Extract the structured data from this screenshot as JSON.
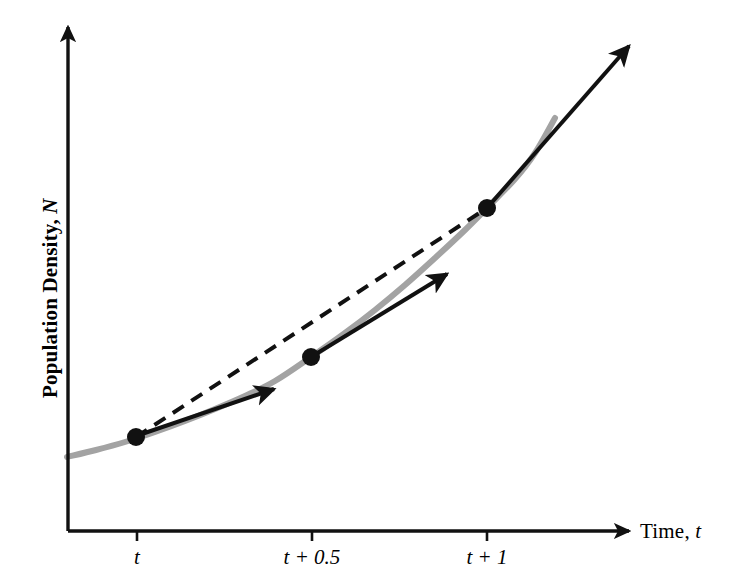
{
  "figure": {
    "kind": "line-chart-with-tangents",
    "background_color": "#ffffff",
    "curve_color": "#a3a3a3",
    "ink_color": "#111111"
  },
  "axes": {
    "y_title_text": "Population Density, ",
    "y_title_symbol": "N",
    "x_title_text": "Time, ",
    "x_title_symbol": "t",
    "x_tick_labels": [
      {
        "id": "tick-t",
        "text": "t"
      },
      {
        "id": "tick-t-half",
        "text": "t + 0.5"
      },
      {
        "id": "tick-t-one",
        "text": "t + 1"
      }
    ]
  },
  "chart_data": {
    "type": "line",
    "title": "",
    "subtitle": "",
    "xlabel": "Time, t",
    "ylabel": "Population Density, N",
    "grid": false,
    "legend": null,
    "axis_arrows": {
      "x": true,
      "y": true
    },
    "xlim": [
      0,
      1.6
    ],
    "ylim": [
      0,
      1.0
    ],
    "x_tick_values": [
      1.0,
      1.5,
      2.0
    ],
    "x_tick_text": [
      "t",
      "t + 0.5",
      "t + 1"
    ],
    "y_tick_values": [],
    "y_tick_text": [],
    "series": [
      {
        "name": "exponential population growth curve",
        "style": "solid",
        "color": "#a3a3a3",
        "width_px": 6,
        "points_px": [
          [
            67,
            457
          ],
          [
            96,
            450
          ],
          [
            125,
            442
          ],
          [
            155,
            432
          ],
          [
            185,
            421
          ],
          [
            215,
            409
          ],
          [
            245,
            396
          ],
          [
            275,
            381
          ],
          [
            311,
            357
          ],
          [
            345,
            333
          ],
          [
            375,
            310
          ],
          [
            405,
            285
          ],
          [
            435,
            258
          ],
          [
            465,
            230
          ],
          [
            487,
            208
          ],
          [
            515,
            179
          ],
          [
            535,
            153
          ],
          [
            555,
            118
          ]
        ]
      },
      {
        "name": "secant line (average rate of change, t to t+1)",
        "style": "dashed",
        "color": "#111111",
        "width_px": 4,
        "dash_px": [
          13,
          9
        ],
        "points_px": [
          [
            136,
            437
          ],
          [
            487,
            208
          ]
        ]
      }
    ],
    "markers": [
      {
        "name": "point-at-t",
        "x_label": "t",
        "px": [
          136,
          437
        ],
        "radius_px": 9,
        "color": "#111111"
      },
      {
        "name": "point-at-t-half",
        "x_label": "t + 0.5",
        "px": [
          311,
          357
        ],
        "radius_px": 9,
        "color": "#111111"
      },
      {
        "name": "point-at-t-one",
        "x_label": "t + 1",
        "px": [
          487,
          208
        ],
        "radius_px": 9,
        "color": "#111111"
      }
    ],
    "annotations": [
      {
        "name": "tangent-arrow-at-t",
        "kind": "arrow",
        "description": "instantaneous rate of change at time t",
        "from_px": [
          136,
          436
        ],
        "to_px": [
          274,
          389
        ],
        "color": "#111111",
        "width_px": 4
      },
      {
        "name": "tangent-arrow-at-t-half",
        "kind": "arrow",
        "description": "instantaneous rate of change at time t + 0.5",
        "from_px": [
          311,
          357
        ],
        "to_px": [
          447,
          274
        ],
        "color": "#111111",
        "width_px": 4
      },
      {
        "name": "tangent-arrow-at-t-one",
        "kind": "arrow",
        "description": "instantaneous rate of change at time t + 1",
        "from_px": [
          487,
          208
        ],
        "to_px": [
          629,
          46
        ],
        "color": "#111111",
        "width_px": 4
      }
    ],
    "geometry_px": {
      "y_axis_x": 68,
      "y_axis_top": 27,
      "y_axis_bottom": 531,
      "x_axis_y": 531,
      "x_axis_left": 68,
      "x_axis_right": 629,
      "tick_x": [
        137,
        312,
        487
      ],
      "tick_length": 10
    }
  }
}
